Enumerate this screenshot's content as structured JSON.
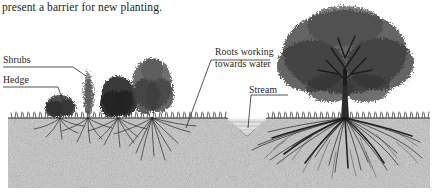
{
  "figure": {
    "caption": "present a barrier for new planting.",
    "type": "cross-section-illustration",
    "medium": "pen-and-ink line drawing",
    "palette": {
      "paper": "#ffffff",
      "ink": "#1a1a1a",
      "soil": "#b9b9b9",
      "soil_dark": "#7d7d7d",
      "water": "#d9d9d9"
    }
  },
  "labels": {
    "shrubs": "Shrubs",
    "hedge": "Hedge",
    "roots_line1": "Roots working",
    "roots_line2": "towards water",
    "stream": "Stream"
  },
  "scene": {
    "ground_line_y": 118,
    "plants": [
      {
        "name": "hedge",
        "x": 60,
        "height": 22,
        "kind": "dense-low-hedge"
      },
      {
        "name": "shrub-columnar",
        "x": 88,
        "height": 48,
        "kind": "upright-light"
      },
      {
        "name": "shrub-round-dark",
        "x": 118,
        "height": 40,
        "kind": "round-dark"
      },
      {
        "name": "shrub-tall-feathery",
        "x": 150,
        "height": 58,
        "kind": "tall-feathery"
      },
      {
        "name": "tree-large",
        "x": 345,
        "height": 112,
        "kind": "broad-deciduous"
      }
    ],
    "stream": {
      "center_x": 247,
      "top_width": 40,
      "depth": 18
    },
    "root_masses": [
      {
        "for": "hedge",
        "x": 60,
        "spread": 30,
        "depth": 20
      },
      {
        "for": "shrub-columnar",
        "x": 88,
        "spread": 30,
        "depth": 24
      },
      {
        "for": "shrub-round-dark",
        "x": 118,
        "spread": 34,
        "depth": 26
      },
      {
        "for": "shrub-tall-feathery",
        "x": 152,
        "spread": 48,
        "depth": 36
      },
      {
        "for": "tree-large",
        "x": 345,
        "spread": 120,
        "depth": 58
      }
    ]
  }
}
